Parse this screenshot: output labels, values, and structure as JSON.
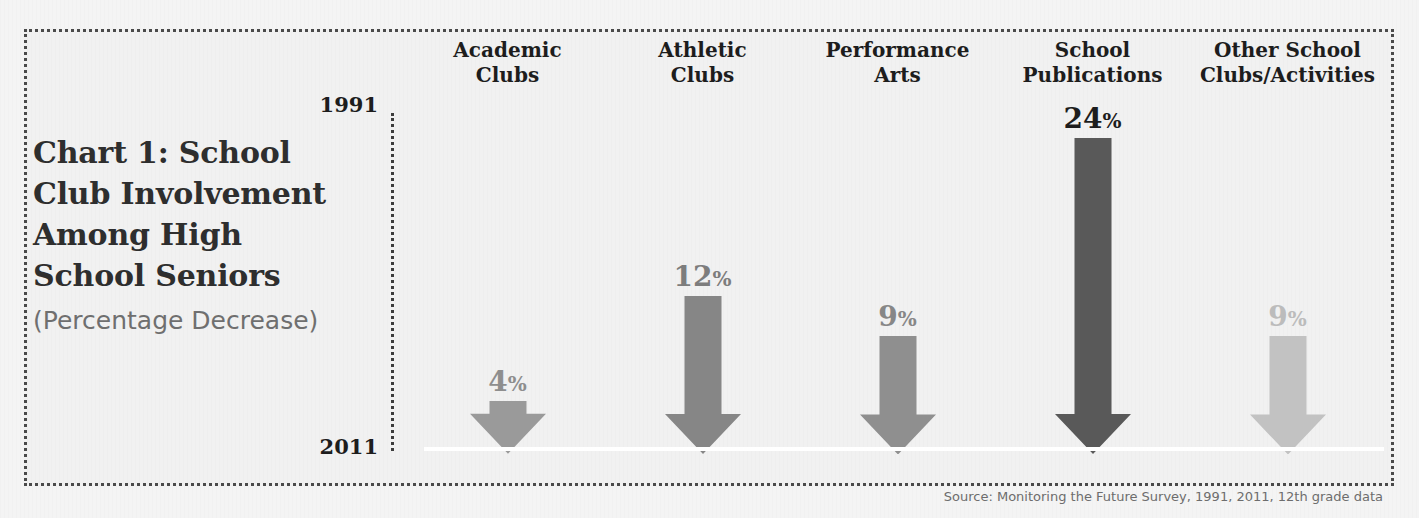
{
  "frame": {
    "border_color": "#4a4a4a",
    "background_color": "#f1f1f1"
  },
  "title": {
    "main": "Chart 1: School Club Involvement Among High School Seniors",
    "subtitle": "(Percentage Decrease)"
  },
  "axis": {
    "top_year": "1991",
    "bottom_year": "2011"
  },
  "source": "Source: Monitoring the Future Survey, 1991, 2011, 12th grade data",
  "chart_data": {
    "type": "bar",
    "title": "Chart 1: School Club Involvement Among High School Seniors",
    "subtitle": "(Percentage Decrease)",
    "xlabel": "",
    "ylabel": "",
    "ylim": [
      0,
      24
    ],
    "grid": false,
    "legend": "none",
    "orientation": "downward-arrows",
    "axis_top_label": "1991",
    "axis_bottom_label": "2011",
    "categories": [
      "Academic Clubs",
      "Athletic Clubs",
      "Performance Arts",
      "School Publications",
      "Other School Clubs/Activities"
    ],
    "values": [
      4,
      12,
      9,
      24,
      9
    ],
    "value_labels": [
      "4%",
      "12%",
      "9%",
      "24%",
      "9%"
    ],
    "colors": [
      "#9a9a9a",
      "#868686",
      "#8f8f8f",
      "#595959",
      "#c2c2c2"
    ],
    "source": "Source: Monitoring the Future Survey, 1991, 2011, 12th grade data"
  },
  "columns": [
    {
      "header_line1": "Academic",
      "header_line2": "Clubs",
      "value": "4",
      "percent_sign": "%",
      "color": "#9a9a9a",
      "label_color": "#8e8e8e"
    },
    {
      "header_line1": "Athletic",
      "header_line2": "Clubs",
      "value": "12",
      "percent_sign": "%",
      "color": "#868686",
      "label_color": "#7d7d7d"
    },
    {
      "header_line1": "Performance",
      "header_line2": "Arts",
      "value": "9",
      "percent_sign": "%",
      "color": "#8f8f8f",
      "label_color": "#878787"
    },
    {
      "header_line1": "School",
      "header_line2": "Publications",
      "value": "24",
      "percent_sign": "%",
      "color": "#595959",
      "label_color": "#1d1d1d"
    },
    {
      "header_line1": "Other School",
      "header_line2": "Clubs/Activities",
      "value": "9",
      "percent_sign": "%",
      "color": "#c2c2c2",
      "label_color": "#bcbcbc"
    }
  ]
}
